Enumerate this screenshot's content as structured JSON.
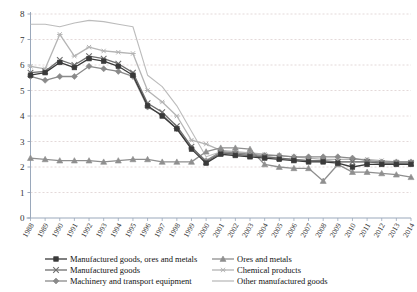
{
  "chart_data": {
    "type": "line",
    "title": "",
    "xlabel": "",
    "ylabel": "",
    "ylim": [
      0,
      8
    ],
    "yticks": [
      0,
      1,
      2,
      3,
      4,
      5,
      6,
      7,
      8
    ],
    "grid": true,
    "legend_position": "bottom",
    "categories": [
      "1988",
      "1989",
      "1990",
      "1991",
      "1992",
      "1993",
      "1994",
      "1995",
      "1996",
      "1997",
      "1998",
      "1999",
      "2000",
      "2001",
      "2002",
      "2003",
      "2004",
      "2005",
      "2006",
      "2007",
      "2008",
      "2009",
      "2010",
      "2011",
      "2012",
      "2013",
      "2014"
    ],
    "series": [
      {
        "name": "Manufactured goods, ores and metals",
        "marker": "square",
        "color": "#3a3a3a",
        "values": [
          5.6,
          5.7,
          6.1,
          5.9,
          6.25,
          6.15,
          5.95,
          5.6,
          4.4,
          4.0,
          3.5,
          2.7,
          2.15,
          2.5,
          2.45,
          2.4,
          2.35,
          2.3,
          2.25,
          2.2,
          2.2,
          2.15,
          2.0,
          2.1,
          2.1,
          2.1,
          2.1
        ]
      },
      {
        "name": "Manufactured goods",
        "marker": "cross",
        "color": "#6e6e6e",
        "values": [
          5.7,
          5.75,
          6.2,
          6.0,
          6.35,
          6.25,
          6.05,
          5.7,
          4.5,
          4.15,
          3.6,
          2.8,
          2.2,
          2.55,
          2.5,
          2.45,
          2.4,
          2.35,
          2.3,
          2.25,
          2.25,
          2.2,
          2.2,
          2.2,
          2.15,
          2.15,
          2.15
        ]
      },
      {
        "name": "Machinery and transport equipment",
        "marker": "diamond",
        "color": "#8a8a8a",
        "values": [
          5.55,
          5.4,
          5.55,
          5.55,
          5.95,
          5.85,
          5.75,
          5.55,
          4.35,
          4.05,
          3.5,
          2.75,
          2.25,
          2.6,
          2.55,
          2.5,
          2.45,
          2.45,
          2.4,
          2.4,
          2.4,
          2.4,
          2.35,
          2.25,
          2.2,
          2.2,
          2.2
        ]
      },
      {
        "name": "Ores and metals",
        "marker": "triangle",
        "color": "#8f8f8f",
        "values": [
          2.35,
          2.3,
          2.25,
          2.25,
          2.25,
          2.2,
          2.25,
          2.3,
          2.3,
          2.2,
          2.2,
          2.2,
          2.6,
          2.75,
          2.75,
          2.7,
          2.1,
          2.0,
          1.95,
          1.95,
          1.45,
          2.1,
          1.8,
          1.8,
          1.75,
          1.7,
          1.6
        ]
      },
      {
        "name": "Chemical products",
        "marker": "asterisk",
        "color": "#b4b4b4",
        "values": [
          5.95,
          5.85,
          7.2,
          6.35,
          6.7,
          6.55,
          6.5,
          6.45,
          5.0,
          4.55,
          4.0,
          3.05,
          2.9,
          2.65,
          2.6,
          2.55,
          2.5,
          2.45,
          2.4,
          2.35,
          2.3,
          2.3,
          2.3,
          2.3,
          2.25,
          2.2,
          2.2
        ]
      },
      {
        "name": "Other manufactured goods",
        "marker": "none",
        "color": "#bcbcbc",
        "values": [
          7.6,
          7.6,
          7.5,
          7.65,
          7.75,
          7.7,
          7.6,
          7.5,
          5.6,
          5.15,
          4.4,
          3.4,
          2.4,
          2.6,
          2.5,
          2.45,
          2.4,
          2.35,
          2.3,
          2.25,
          2.2,
          2.2,
          2.2,
          2.2,
          2.15,
          2.15,
          2.1
        ]
      }
    ]
  },
  "axis": {
    "y_tick_labels": [
      "0",
      "1",
      "2",
      "3",
      "4",
      "5",
      "6",
      "7",
      "8"
    ],
    "x_tick_labels": [
      "1988",
      "1989",
      "1990",
      "1991",
      "1992",
      "1993",
      "1994",
      "1995",
      "1996",
      "1997",
      "1998",
      "1999",
      "2000",
      "2001",
      "2002",
      "2003",
      "2004",
      "2005",
      "2006",
      "2007",
      "2008",
      "2009",
      "2010",
      "2011",
      "2012",
      "2013",
      "2014"
    ]
  },
  "legend": {
    "left_column": [
      {
        "label": "Manufactured goods, ores and metals",
        "marker": "square",
        "color": "#3a3a3a"
      },
      {
        "label": "Manufactured goods",
        "marker": "cross",
        "color": "#6e6e6e"
      },
      {
        "label": "Machinery and transport equipment",
        "marker": "diamond",
        "color": "#8a8a8a"
      }
    ],
    "right_column": [
      {
        "label": "Ores and metals",
        "marker": "triangle",
        "color": "#8f8f8f"
      },
      {
        "label": "Chemical products",
        "marker": "asterisk",
        "color": "#b4b4b4"
      },
      {
        "label": "Other manufactured goods",
        "marker": "none",
        "color": "#bcbcbc"
      }
    ]
  },
  "colors": {
    "grid": "#d8c8c8",
    "axis": "#9aa8bb",
    "text": "#333333"
  }
}
